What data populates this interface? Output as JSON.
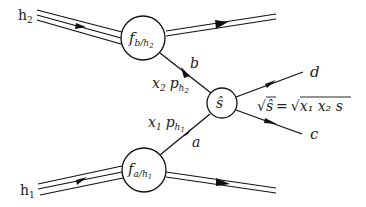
{
  "diagram": {
    "type": "parton-model hard scattering",
    "hadron_top": {
      "label": "h",
      "sub": "2"
    },
    "hadron_bottom": {
      "label": "h",
      "sub": "1"
    },
    "pdf_top": {
      "f": "f",
      "sub": "b/h",
      "subsub": "2"
    },
    "pdf_bottom": {
      "f": "f",
      "sub": "a/h",
      "subsub": "1"
    },
    "parton_top": {
      "label": "b"
    },
    "parton_bottom": {
      "label": "a"
    },
    "momentum_top": {
      "x": "x",
      "xsub": "2",
      "p": "p",
      "psub": "h",
      "psubsub": "2"
    },
    "momentum_bottom": {
      "x": "x",
      "xsub": "1",
      "p": "p",
      "psub": "h",
      "psubsub": "1"
    },
    "hard_process": {
      "label": "ŝ"
    },
    "outgoing_top": {
      "label": "d"
    },
    "outgoing_bottom": {
      "label": "c"
    },
    "energy_relation": {
      "lhs": "√ŝ",
      "eq": "=",
      "rhs": "√",
      "rhs_body": "x₁ x₂ s"
    },
    "colors": {
      "stroke": "#111111",
      "background": "#ffffff"
    }
  }
}
